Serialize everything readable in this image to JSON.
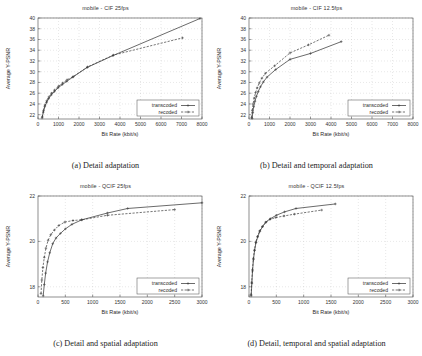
{
  "figure": {
    "series_names": [
      "transcoded",
      "recoded"
    ],
    "axis_labels": {
      "x": "Bit Rate (kbit/s)",
      "y": "Average Y-PSNR"
    }
  },
  "panels": [
    {
      "caption": "(a) Detail adaptation",
      "chart_data": {
        "type": "line",
        "title": "mobile - CIF  25fps",
        "xlabel": "Bit Rate (kbit/s)",
        "ylabel": "Average Y-PSNR",
        "xlim": [
          0,
          8000
        ],
        "ylim": [
          21.2,
          40
        ],
        "xticks": [
          0,
          1000,
          2000,
          3000,
          4000,
          5000,
          6000,
          7000,
          8000
        ],
        "yticks": [
          22,
          24,
          26,
          28,
          30,
          32,
          34,
          36,
          38,
          40
        ],
        "grid": true,
        "legend_position": "bottom-right",
        "series": [
          {
            "name": "transcoded",
            "x": [
              200,
              260,
              330,
              420,
              520,
              650,
              800,
              980,
              1180,
              1400,
              1700,
              2400,
              3650,
              7900
            ],
            "y": [
              21.4,
              22.5,
              23.5,
              24.3,
              25.0,
              25.7,
              26.3,
              27.0,
              27.6,
              28.2,
              29.0,
              30.8,
              33.0,
              39.9
            ]
          },
          {
            "name": "recoded",
            "x": [
              210,
              270,
              340,
              430,
              530,
              660,
              810,
              1000,
              1200,
              1420,
              1720,
              2420,
              3680,
              7050
            ],
            "y": [
              21.6,
              22.8,
              23.8,
              24.6,
              25.3,
              26.0,
              26.6,
              27.3,
              27.9,
              28.5,
              29.1,
              30.9,
              33.1,
              36.3
            ]
          }
        ]
      }
    },
    {
      "caption": "(b) Detail and temporal adaptation",
      "chart_data": {
        "type": "line",
        "title": "mobile - CIF  12.5fps",
        "xlabel": "Bit Rate (kbit/s)",
        "ylabel": "Average Y-PSNR",
        "xlim": [
          0,
          8000
        ],
        "ylim": [
          21.2,
          40
        ],
        "xticks": [
          0,
          1000,
          2000,
          3000,
          4000,
          5000,
          6000,
          7000,
          8000
        ],
        "yticks": [
          22,
          24,
          26,
          28,
          30,
          32,
          34,
          36,
          38,
          40
        ],
        "grid": true,
        "legend_position": "bottom-right",
        "series": [
          {
            "name": "transcoded",
            "x": [
              150,
              185,
              230,
              290,
              360,
              450,
              560,
              700,
              880,
              1300,
              2000,
              3000,
              4500
            ],
            "y": [
              21.3,
              22.4,
              23.5,
              24.5,
              25.4,
              26.3,
              27.2,
              28.1,
              29.0,
              30.4,
              32.3,
              33.4,
              35.6
            ]
          },
          {
            "name": "recoded",
            "x": [
              130,
              160,
              200,
              255,
              320,
              400,
              500,
              630,
              800,
              1250,
              2000,
              2900,
              3900
            ],
            "y": [
              21.5,
              22.8,
              24.0,
              25.1,
              26.1,
              27.0,
              27.9,
              28.8,
              29.7,
              31.1,
              33.5,
              35.0,
              36.8
            ]
          }
        ]
      }
    },
    {
      "caption": "(c) Detail and spatial adaptation",
      "chart_data": {
        "type": "line",
        "title": "mobile - QCIF  25fps",
        "xlabel": "Bit Rate (kbit/s)",
        "ylabel": "Average Y-PSNR",
        "xlim": [
          0,
          3000
        ],
        "ylim": [
          17.55,
          22
        ],
        "xticks": [
          0,
          500,
          1000,
          1500,
          2000,
          2500,
          3000
        ],
        "yticks": [
          18,
          20,
          22
        ],
        "grid": true,
        "legend_position": "bottom-right",
        "series": [
          {
            "name": "transcoded",
            "x": [
              95,
              115,
              140,
              175,
              215,
              270,
              330,
              410,
              500,
              620,
              800,
              1270,
              1640,
              3000
            ],
            "y": [
              17.6,
              18.1,
              18.6,
              19.1,
              19.5,
              19.9,
              20.15,
              20.35,
              20.55,
              20.75,
              20.95,
              21.25,
              21.45,
              21.7
            ]
          },
          {
            "name": "recoded",
            "x": [
              55,
              70,
              90,
              115,
              145,
              185,
              235,
              300,
              380,
              490,
              640,
              800,
              1270,
              2500
            ],
            "y": [
              17.7,
              18.3,
              18.85,
              19.3,
              19.7,
              20.05,
              20.3,
              20.5,
              20.7,
              20.85,
              20.92,
              20.95,
              21.15,
              21.4
            ]
          }
        ]
      }
    },
    {
      "caption": "(d) Detail, temporal and spatial adaptation",
      "chart_data": {
        "type": "line",
        "title": "mobile - QCIF  12.5fps",
        "xlabel": "Bit Rate (kbit/s)",
        "ylabel": "Average Y-PSNR",
        "xlim": [
          0,
          3000
        ],
        "ylim": [
          17.55,
          22
        ],
        "xticks": [
          0,
          500,
          1000,
          1500,
          2000,
          2500,
          3000
        ],
        "yticks": [
          18,
          20,
          22
        ],
        "grid": true,
        "legend_position": "bottom-right",
        "series": [
          {
            "name": "transcoded",
            "x": [
              40,
              52,
              65,
              82,
              102,
              128,
              160,
              200,
              250,
              310,
              390,
              500,
              650,
              860,
              1580
            ],
            "y": [
              17.6,
              18.15,
              18.7,
              19.2,
              19.6,
              19.95,
              20.2,
              20.45,
              20.65,
              20.85,
              21.0,
              21.15,
              21.3,
              21.45,
              21.65
            ]
          },
          {
            "name": "recoded",
            "x": [
              38,
              50,
              63,
              80,
              100,
              125,
              156,
              195,
              245,
              305,
              385,
              490,
              640,
              830,
              1330
            ],
            "y": [
              17.65,
              18.2,
              18.75,
              19.25,
              19.62,
              19.97,
              20.22,
              20.46,
              20.66,
              20.84,
              20.97,
              21.05,
              21.12,
              21.2,
              21.38
            ]
          }
        ]
      }
    }
  ]
}
